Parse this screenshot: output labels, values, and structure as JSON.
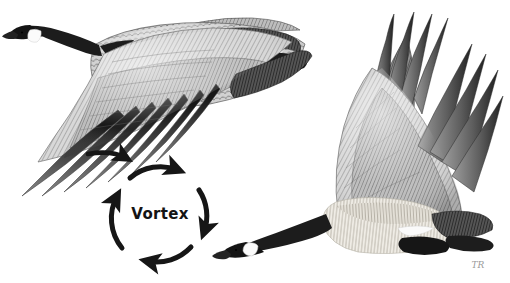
{
  "image": {
    "kind": "pen-and-ink / stipple wildlife illustration",
    "subject": "Two Canada geese in flight with wingtip vortex diagram",
    "background_color": "#ffffff",
    "width": 510,
    "height": 283
  },
  "palette": {
    "paper": "#ffffff",
    "ink_black": "#141414",
    "neck_black": "#1c1c1c",
    "feather_dark": "#4a4a4a",
    "feather_mid": "#8d8d8d",
    "feather_light": "#c9c9c9",
    "breast_pale": "#ebe7e0",
    "cheek_white": "#fbfbfb",
    "arrow_black": "#161616",
    "signature_grey": "#9a9a9a"
  },
  "birds": [
    {
      "id": "lead-goose",
      "name": "Canada goose, lead bird (upper left)",
      "pose": "gliding left, near wing swept down and back",
      "facing": "left",
      "parts": [
        "bill",
        "black-head",
        "white-cheek-patch",
        "black-neck",
        "body",
        "upper-wing",
        "primary-feathers",
        "white-rump-band",
        "black-tail"
      ]
    },
    {
      "id": "trailing-goose",
      "name": "Canada goose, trailing bird (lower right)",
      "pose": "wings raised on upstroke, body level",
      "facing": "left",
      "parts": [
        "bill",
        "black-head",
        "white-cheek-patch",
        "black-neck",
        "pale-breast",
        "near-wing",
        "far-wing",
        "primary-feathers",
        "white-rump-band",
        "black-tail",
        "tucked-feet"
      ]
    }
  ],
  "diagram": {
    "label": "Vortex",
    "rotation": "clockwise",
    "arrow_count": 4,
    "lead_in_arrow": {
      "name": "wingtip-airflow-arrow",
      "direction": "left-to-right",
      "description": "straight arrow from lead goose wingtip into vortex circle"
    },
    "center": {
      "x": 160,
      "y": 213
    },
    "radius": 47
  },
  "signature": {
    "text": "TR",
    "position": "bottom-right",
    "description": "faint artist monogram"
  }
}
